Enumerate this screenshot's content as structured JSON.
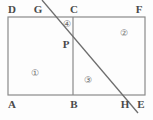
{
  "figure": {
    "canvas": {
      "width": 153,
      "height": 120
    },
    "colors": {
      "background": "#fdfdfd",
      "stroke": "#8a8a8a",
      "diagonal_stroke": "#6e6e6e",
      "label_text": "#4a4a4a",
      "region_text": "#6b6b6b"
    },
    "rectangle": {
      "name": "ADFE",
      "left": 8,
      "top": 17,
      "right": 145,
      "bottom": 95
    },
    "segments": [
      {
        "name": "segment-BC",
        "x1": 73,
        "y1": 17,
        "x2": 73,
        "y2": 95
      },
      {
        "name": "diagonal-GH",
        "x1": 42,
        "y1": 0,
        "x2": 138,
        "y2": 113
      }
    ],
    "points": [
      {
        "key": "D",
        "label": "D",
        "x": 12,
        "y": 9
      },
      {
        "key": "G",
        "label": "G",
        "x": 38,
        "y": 9
      },
      {
        "key": "C",
        "label": "C",
        "x": 74,
        "y": 9
      },
      {
        "key": "F",
        "label": "F",
        "x": 139,
        "y": 9
      },
      {
        "key": "P",
        "label": "P",
        "x": 66,
        "y": 44
      },
      {
        "key": "A",
        "label": "A",
        "x": 12,
        "y": 104
      },
      {
        "key": "B",
        "label": "B",
        "x": 74,
        "y": 104
      },
      {
        "key": "H",
        "label": "H",
        "x": 125,
        "y": 104
      },
      {
        "key": "E",
        "label": "E",
        "x": 141,
        "y": 104
      }
    ],
    "regions": [
      {
        "key": "r1",
        "label": "①",
        "x": 35,
        "y": 73
      },
      {
        "key": "r2",
        "label": "②",
        "x": 124,
        "y": 33
      },
      {
        "key": "r3",
        "label": "③",
        "x": 88,
        "y": 80
      },
      {
        "key": "r4",
        "label": "④",
        "x": 67,
        "y": 24
      }
    ]
  }
}
